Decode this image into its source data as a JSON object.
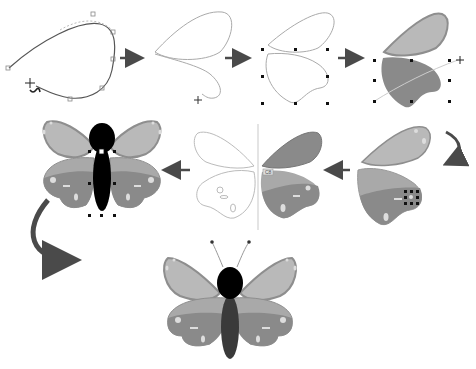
{
  "diagram": {
    "steps": [
      {
        "id": 1,
        "label": "Draw curved wing outline with pen tool"
      },
      {
        "id": 2,
        "label": "Duplicate and shape second wing path"
      },
      {
        "id": 3,
        "label": "Select both wing outlines"
      },
      {
        "id": 4,
        "label": "Fill wings with gradient"
      },
      {
        "id": 5,
        "label": "Add spots to wings"
      },
      {
        "id": 6,
        "label": "Mirror wings across vertical axis"
      },
      {
        "id": 7,
        "label": "Add body with selection handles"
      },
      {
        "id": 8,
        "label": "Finished butterfly with antennae"
      }
    ],
    "colors": {
      "upper_wing_light": "#b9b9b9",
      "upper_wing_border": "#8e8e8e",
      "lower_wing_light": "#a9a9a9",
      "lower_wing_dark": "#8a8a8a",
      "wing_edge": "#7a7a7a",
      "spot": "#dcdcdc",
      "body_head": "#000000",
      "body_abdomen": "#3a3a3a",
      "arrow": "#4a4a4a",
      "outline": "#9a9a9a",
      "handle": "#111111"
    },
    "snap_label": "C8"
  }
}
